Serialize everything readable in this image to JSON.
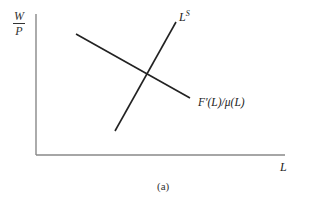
{
  "diagram": {
    "y_axis_label": {
      "numerator": "W",
      "denominator": "P"
    },
    "x_axis_label": "L",
    "supply_curve": {
      "label_base": "L",
      "label_sup": "S"
    },
    "demand_curve": {
      "label": "F′(L)/μ(L)"
    },
    "caption": "(a)"
  },
  "colors": {
    "axis": "#777777",
    "curve": "#222222",
    "text": "#333333"
  }
}
